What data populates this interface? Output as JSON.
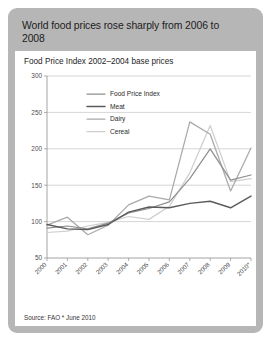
{
  "title": "World food prices rose sharply from 2006 to 2008",
  "subtitle": "Food Price Index 2002–2004 base prices",
  "source": "Source: FAO  * June 2010",
  "colors": {
    "frame": "#b6b6b6",
    "panel": "#ffffff",
    "grid": "#b9b9b9",
    "food_price_index": "#8f8f8f",
    "meat": "#5b5b5b",
    "dairy": "#a9a9a9",
    "cereal": "#cfcfcf"
  },
  "chart_data": {
    "type": "line",
    "title": "Food Price Index 2002–2004 base prices",
    "xlabel": "",
    "ylabel": "",
    "ylim": [
      50,
      300
    ],
    "yticks": [
      50,
      100,
      150,
      200,
      250,
      300
    ],
    "grid": true,
    "legend_position": "inside-top-left",
    "categories": [
      "2000",
      "2001",
      "2002",
      "2003",
      "2004",
      "2005",
      "2006",
      "2007",
      "2008",
      "2009",
      "2010*"
    ],
    "series": [
      {
        "name": "Food Price Index",
        "values": [
          91,
          94,
          90,
          98,
          112,
          118,
          127,
          159,
          200,
          157,
          164
        ]
      },
      {
        "name": "Meat",
        "values": [
          96,
          90,
          89,
          96,
          113,
          120,
          119,
          125,
          128,
          119,
          135
        ]
      },
      {
        "name": "Dairy",
        "values": [
          95,
          106,
          82,
          95,
          123,
          135,
          130,
          237,
          220,
          142,
          201
        ]
      },
      {
        "name": "Cereal",
        "values": [
          85,
          87,
          94,
          99,
          107,
          103,
          121,
          167,
          232,
          155,
          159
        ]
      }
    ],
    "annotations": [
      "* June 2010"
    ]
  }
}
